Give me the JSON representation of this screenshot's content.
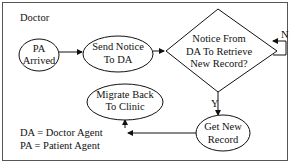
{
  "title": "Doctor",
  "nodes": {
    "pa_arrived": {
      "line1": "PA",
      "line2": "Arrived"
    },
    "send_notice": {
      "line1": "Send Notice",
      "line2": "To DA"
    },
    "decision": {
      "line1": "Notice From",
      "line2": "DA To Retrieve",
      "line3": "New Record?"
    },
    "get_record": {
      "line1": "Get New",
      "line2": "Record"
    },
    "migrate_back": {
      "line1": "Migrate Back",
      "line2": "To Clinic"
    }
  },
  "edges": {
    "no_label": "N",
    "yes_label": "Y"
  },
  "legend": [
    {
      "text": "DA = Doctor Agent"
    },
    {
      "text": "PA = Patient Agent"
    }
  ]
}
